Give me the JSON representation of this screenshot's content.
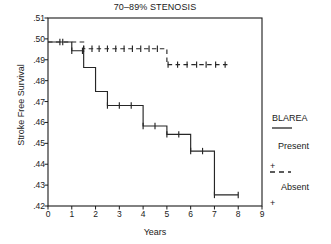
{
  "chart_data": {
    "type": "line",
    "title": "70–89% STENOSIS",
    "xlabel": "Years",
    "ylabel": "Stroke Free Survival",
    "xlim": [
      0,
      9
    ],
    "ylim": [
      0.42,
      0.51
    ],
    "xticks": [
      "0",
      "1",
      "2",
      "3",
      "4",
      "5",
      "6",
      "7",
      "8",
      "9"
    ],
    "yticks": [
      ".51",
      ".50",
      ".49",
      ".48",
      ".47",
      ".46",
      ".45",
      ".44",
      ".43",
      ".42"
    ],
    "grid": false,
    "legend_position": "right",
    "series": [
      {
        "name": "Present",
        "style": "solid",
        "steps": [
          {
            "x": 0.0,
            "y": 0.4985
          },
          {
            "x": 1.0,
            "y": 0.4943
          },
          {
            "x": 1.5,
            "y": 0.4863
          },
          {
            "x": 2.0,
            "y": 0.4748
          },
          {
            "x": 2.5,
            "y": 0.4681
          },
          {
            "x": 4.0,
            "y": 0.4583
          },
          {
            "x": 5.0,
            "y": 0.4543
          },
          {
            "x": 6.0,
            "y": 0.4463
          },
          {
            "x": 7.0,
            "y": 0.4253
          },
          {
            "x": 8.0,
            "y": 0.4253
          }
        ],
        "censors": [
          {
            "x": 0.5,
            "y": 0.4985
          },
          {
            "x": 0.62,
            "y": 0.4985
          },
          {
            "x": 1.0,
            "y": 0.4943
          },
          {
            "x": 1.45,
            "y": 0.4943
          },
          {
            "x": 2.5,
            "y": 0.4681
          },
          {
            "x": 3.0,
            "y": 0.4681
          },
          {
            "x": 3.5,
            "y": 0.4681
          },
          {
            "x": 4.0,
            "y": 0.4583
          },
          {
            "x": 4.5,
            "y": 0.4583
          },
          {
            "x": 5.0,
            "y": 0.4543
          },
          {
            "x": 5.5,
            "y": 0.4543
          },
          {
            "x": 6.0,
            "y": 0.4463
          },
          {
            "x": 6.5,
            "y": 0.4463
          },
          {
            "x": 7.0,
            "y": 0.4253
          },
          {
            "x": 8.0,
            "y": 0.4253
          }
        ]
      },
      {
        "name": "Absent",
        "style": "dashed",
        "steps": [
          {
            "x": 0.0,
            "y": 0.4985
          },
          {
            "x": 1.5,
            "y": 0.4953
          },
          {
            "x": 5.0,
            "y": 0.4877
          },
          {
            "x": 7.6,
            "y": 0.4877
          }
        ],
        "censors": [
          {
            "x": 1.5,
            "y": 0.4953
          },
          {
            "x": 1.85,
            "y": 0.4953
          },
          {
            "x": 2.15,
            "y": 0.4953
          },
          {
            "x": 2.5,
            "y": 0.4953
          },
          {
            "x": 2.85,
            "y": 0.4953
          },
          {
            "x": 3.2,
            "y": 0.4953
          },
          {
            "x": 3.55,
            "y": 0.4953
          },
          {
            "x": 3.9,
            "y": 0.4953
          },
          {
            "x": 4.25,
            "y": 0.4953
          },
          {
            "x": 4.6,
            "y": 0.4953
          },
          {
            "x": 5.05,
            "y": 0.4877
          },
          {
            "x": 5.45,
            "y": 0.4877
          },
          {
            "x": 5.85,
            "y": 0.4877
          },
          {
            "x": 6.25,
            "y": 0.4877
          },
          {
            "x": 6.65,
            "y": 0.4877
          },
          {
            "x": 7.05,
            "y": 0.4877
          },
          {
            "x": 7.45,
            "y": 0.4877
          }
        ]
      }
    ]
  },
  "legend": {
    "header": "BLAREA",
    "entries": [
      {
        "label": "Present",
        "style": "solid"
      },
      {
        "label": "Absent",
        "style": "dashed"
      }
    ]
  },
  "colors": {
    "axis": "#1a1a1a",
    "curve": "#262626",
    "text": "#1a1a1a"
  }
}
